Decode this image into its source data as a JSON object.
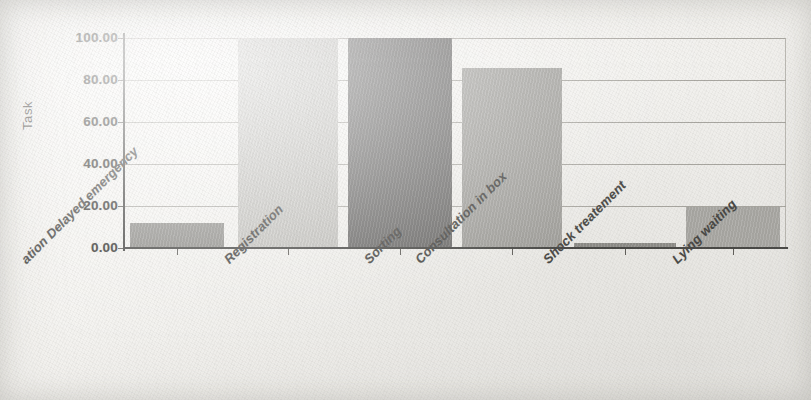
{
  "chart_data": {
    "type": "bar",
    "title": "",
    "subtitle": "",
    "xlabel": "",
    "ylabel": "Task",
    "ylim": [
      0,
      100
    ],
    "xlim": null,
    "grid": true,
    "legend": null,
    "legend_position": "none",
    "y_tick_labels": [
      "0.00",
      "20.00",
      "40.00",
      "60.00",
      "80.00",
      "100.00"
    ],
    "y_ticks": [
      0,
      20,
      40,
      60,
      80,
      100
    ],
    "categories": [
      "ation Delayed emergency",
      "Registration",
      "Sorting",
      "Consultation in box",
      "Shock treatement",
      "Lying waiting"
    ],
    "values": [
      11.7,
      100,
      100,
      85.7,
      2.4,
      19.3
    ],
    "bar_colors": [
      "#8e8d89",
      "#c6c5c1",
      "#656463",
      "#a3a29e",
      "#8d8c88",
      "#adaca8"
    ],
    "background_color": "#f4f3f0",
    "axis_color": "#3a3a38",
    "grid_color": "#a8a6a0"
  },
  "axis": {
    "y_title": "Task"
  }
}
